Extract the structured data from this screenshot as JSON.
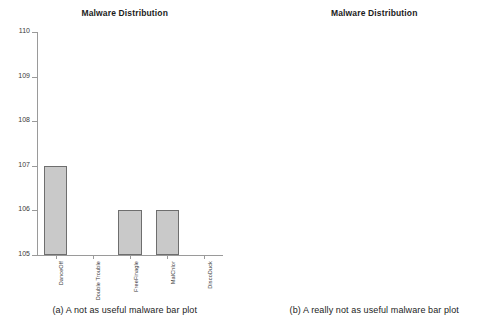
{
  "figure": {
    "panels": [
      {
        "id": "panel-a",
        "title": "Malware Distribution",
        "caption": "(a) A not as useful malware bar plot",
        "axis_style": "left-spine-with-ticks",
        "y_ticks": [
          "105",
          "106",
          "107",
          "108",
          "109",
          "110"
        ],
        "x_labels": [
          "DanceOff",
          "Double Trouble",
          "FreeFinagle",
          "MalChlor",
          "DiscoDuck"
        ]
      },
      {
        "id": "panel-b",
        "title": "Malware Distribution",
        "caption": "(b) A really not as useful malware bar plot",
        "axis_style": "full-box-no-ticks",
        "y_ticks": [],
        "x_labels": [
          "DanceOff",
          "Double Trouble",
          "FreeFinagle",
          "MalChlor",
          "DiscoDuck"
        ]
      }
    ]
  },
  "colors": {
    "bar_fill": "#c9c9c9",
    "bar_edge": "#6e6e6e",
    "axis": "#9a9a9a",
    "text": "#1c1c1c",
    "background": "#ffffff"
  },
  "chart_data": [
    {
      "type": "bar",
      "title": "Malware Distribution",
      "caption": "(a) A not as useful malware bar plot",
      "categories": [
        "DanceOff",
        "Double Trouble",
        "FreeFinagle",
        "MalChlor",
        "DiscoDuck"
      ],
      "values": [
        107,
        105,
        106,
        106,
        105
      ],
      "xlabel": "",
      "ylabel": "",
      "ylim": [
        105,
        110
      ],
      "yticks": [
        105,
        106,
        107,
        108,
        109,
        110
      ],
      "grid": false,
      "legend": false,
      "notes": "Y axis truncated at 105, exaggerating differences; bars at 105 render with zero height."
    },
    {
      "type": "bar",
      "title": "Malware Distribution",
      "caption": "(b) A really not as useful malware bar plot",
      "categories": [
        "DanceOff",
        "Double Trouble",
        "FreeFinagle",
        "MalChlor",
        "DiscoDuck"
      ],
      "values": [
        107,
        0,
        106,
        106,
        0
      ],
      "xlabel": "",
      "ylabel": "",
      "ylim": [
        0,
        175
      ],
      "yticks": [],
      "grid": false,
      "legend": false,
      "notes": "No y axis labels shown; full box frame; zero-valued bars render with no height."
    }
  ]
}
